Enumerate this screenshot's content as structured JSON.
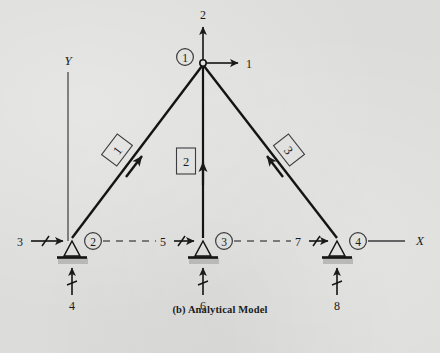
{
  "figure": {
    "caption": "(b) Analytical Model",
    "type": "structural-truss-analytical-model",
    "background_color": "#dcdcda",
    "ink_color": "#1a1a1a"
  },
  "axes": {
    "y_label": "Y",
    "x_label": "X"
  },
  "joints": [
    {
      "id": "1",
      "label": "1",
      "x": 203,
      "y": 63,
      "support": "none",
      "label_dx": -18,
      "label_dy": -6
    },
    {
      "id": "2",
      "label": "2",
      "x": 72,
      "y": 241,
      "support": "pin",
      "label_dx": 21,
      "label_dy": 0
    },
    {
      "id": "3",
      "label": "3",
      "x": 203,
      "y": 241,
      "support": "pin",
      "label_dx": 21,
      "label_dy": 0
    },
    {
      "id": "4",
      "label": "4",
      "x": 337,
      "y": 241,
      "support": "pin",
      "label_dx": 21,
      "label_dy": 0
    }
  ],
  "members": [
    {
      "label": "1",
      "from": "2",
      "to": "1",
      "label_x": 117,
      "label_y": 150,
      "label_rotation": -53,
      "box_shape": "parallelogram"
    },
    {
      "label": "2",
      "from": "3",
      "to": "1",
      "label_x": 186,
      "label_y": 161,
      "label_rotation": 0,
      "box_shape": "rectangle"
    },
    {
      "label": "3",
      "from": "4",
      "to": "1",
      "label_x": 289,
      "label_y": 150,
      "label_rotation": 52,
      "box_shape": "parallelogram"
    }
  ],
  "degrees_of_freedom": [
    {
      "number": "1",
      "joint": "1",
      "direction": "horizontal-right",
      "label_x": 249,
      "label_y": 63
    },
    {
      "number": "2",
      "joint": "1",
      "direction": "vertical-up",
      "label_x": 203,
      "label_y": 15
    },
    {
      "number": "3",
      "joint": "2",
      "direction": "horizontal-right",
      "label_x": 20,
      "label_y": 241
    },
    {
      "number": "4",
      "joint": "2",
      "direction": "vertical-up",
      "label_x": 72,
      "label_y": 306
    },
    {
      "number": "5",
      "joint": "3",
      "direction": "horizontal-right",
      "label_x": 163,
      "label_y": 241
    },
    {
      "number": "6",
      "joint": "3",
      "direction": "vertical-up",
      "label_x": 203,
      "label_y": 306
    },
    {
      "number": "7",
      "joint": "4",
      "direction": "horizontal-right",
      "label_x": 298,
      "label_y": 241
    },
    {
      "number": "8",
      "joint": "4",
      "direction": "vertical-up",
      "label_x": 337,
      "label_y": 306
    }
  ]
}
